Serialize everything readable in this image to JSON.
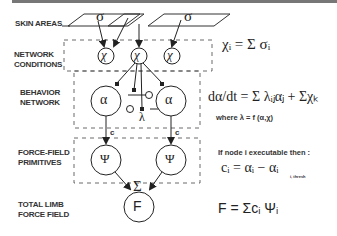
{
  "labels": {
    "skin_areas": "SKIN AREAS",
    "network_conditions_1": "NETWORK",
    "network_conditions_2": "CONDITIONS",
    "behavior_network_1": "BEHAVIOR",
    "behavior_network_2": "NETWORK",
    "force_field_1": "FORCE-FIELD",
    "force_field_2": "PRIMITIVES",
    "total_limb_1": "TOTAL LIMB",
    "total_limb_2": "FORCE FIELD"
  },
  "nodes": {
    "sigma": "σ",
    "chi": "χ",
    "alpha": "α",
    "lambda": "λ",
    "psi": "Ψ",
    "sum": "Σ",
    "force": "F",
    "c": "c"
  },
  "equations": {
    "chi_eq": "χᵢ = Σ σᵢ",
    "alpha_eq": "dα/dt = Σ λᵢⱼαⱼ + Σχₖ",
    "where": "where  λ = f (α,χ)",
    "if_node": "If node i executable then :",
    "c_eq": "cᵢ = αᵢ  −  αᵢ",
    "c_eq_sub": "i, thresh",
    "f_eq": "F = Σcᵢ Ψᵢ"
  }
}
